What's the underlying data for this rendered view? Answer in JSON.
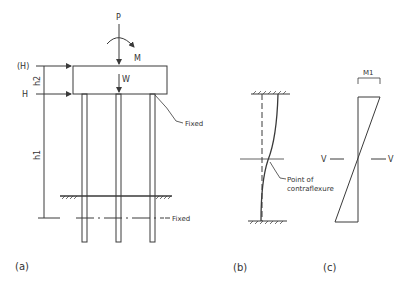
{
  "figure": {
    "panel_a": {
      "caption": "(a)",
      "load_labels": {
        "vertical_load": "P",
        "moment": "M",
        "weight": "W",
        "horizontal_top": "(H)",
        "horizontal": "H"
      },
      "dimension_labels": {
        "cap_height": "h2",
        "pile_length": "h1"
      },
      "annotations": {
        "fixed_top": "Fixed",
        "fixed_bottom": "Fixed"
      }
    },
    "panel_b": {
      "caption": "(b)",
      "annotation": "Point of\ncontraflexure",
      "annotation_line1": "Point of",
      "annotation_line2": "contraflexure"
    },
    "panel_c": {
      "caption": "(c)",
      "moment_label": "M1",
      "shear_left": "V",
      "shear_right": "V"
    }
  },
  "colors": {
    "line": "#3a3a3a",
    "background": "#ffffff"
  }
}
